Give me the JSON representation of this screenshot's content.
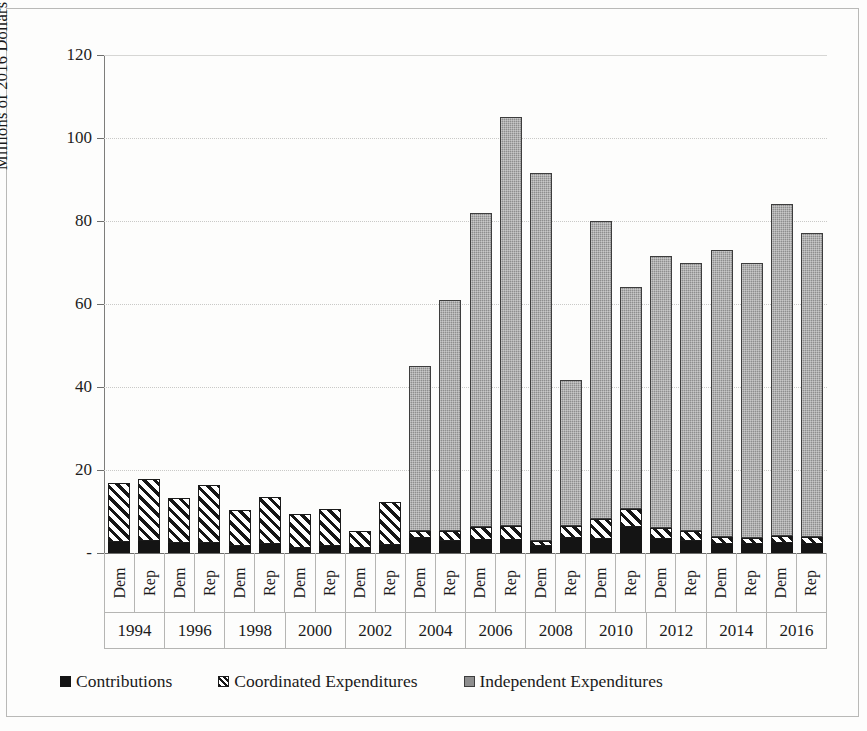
{
  "chart_data": {
    "type": "bar",
    "stacked": true,
    "title": "",
    "xlabel": "",
    "ylabel": "Millions of 2016 Dollars",
    "ylim": [
      0,
      120
    ],
    "ytick_labels": [
      "-",
      "20",
      "40",
      "60",
      "80",
      "100",
      "120"
    ],
    "ytick_values": [
      0,
      20,
      40,
      60,
      80,
      100,
      120
    ],
    "grid": true,
    "legend_position": "bottom",
    "years": [
      "1994",
      "1996",
      "1998",
      "2000",
      "2002",
      "2004",
      "2006",
      "2008",
      "2010",
      "2012",
      "2014",
      "2016"
    ],
    "parties": [
      "Dem",
      "Rep"
    ],
    "categories": [
      "1994 Dem",
      "1994 Rep",
      "1996 Dem",
      "1996 Rep",
      "1998 Dem",
      "1998 Rep",
      "2000 Dem",
      "2000 Rep",
      "2002 Dem",
      "2002 Rep",
      "2004 Dem",
      "2004 Rep",
      "2006 Dem",
      "2006 Rep",
      "2008 Dem",
      "2008 Rep",
      "2010 Dem",
      "2010 Rep",
      "2012 Dem",
      "2012 Rep",
      "2014 Dem",
      "2014 Rep",
      "2016 Dem",
      "2016 Rep"
    ],
    "series": [
      {
        "name": "Contributions",
        "color": "#141414",
        "pattern": "solid-black",
        "values": [
          2.6,
          2.8,
          2.3,
          2.5,
          1.8,
          2.2,
          1.3,
          1.7,
          1.2,
          2.0,
          3.6,
          3.0,
          3.2,
          3.1,
          1.6,
          3.6,
          3.4,
          6.2,
          3.3,
          3.0,
          2.2,
          2.2,
          2.3,
          2.2
        ]
      },
      {
        "name": "Coordinated Expenditures",
        "color": "#ffffff",
        "pattern": "diagonal-hatch",
        "values": [
          14.2,
          15.1,
          10.9,
          13.9,
          8.5,
          11.2,
          8.1,
          9.0,
          4.0,
          10.2,
          1.7,
          2.3,
          3.0,
          3.4,
          1.2,
          3.0,
          4.8,
          4.3,
          2.8,
          2.3,
          1.6,
          1.5,
          1.9,
          1.6
        ]
      },
      {
        "name": "Independent Expenditures",
        "color": "#8e8e8e",
        "pattern": "gray-dither",
        "values": [
          0,
          0,
          0,
          0,
          0,
          0,
          0,
          0,
          0,
          0,
          39.7,
          55.7,
          75.8,
          98.5,
          88.7,
          35.0,
          71.8,
          53.5,
          65.4,
          64.7,
          69.2,
          66.3,
          79.8,
          73.2
        ]
      }
    ],
    "totals": [
      16.8,
      17.9,
      13.2,
      16.4,
      10.3,
      13.4,
      9.4,
      10.7,
      5.2,
      12.2,
      45.0,
      61.0,
      82.0,
      105.0,
      93.5,
      41.6,
      80.0,
      64.0,
      71.5,
      70.0,
      73.0,
      70.0,
      84.0,
      77.0
    ]
  },
  "legend": {
    "items": [
      {
        "label": "Contributions",
        "swatch": "contrib"
      },
      {
        "label": "Coordinated Expenditures",
        "swatch": "coord"
      },
      {
        "label": "Independent Expenditures",
        "swatch": "indep"
      }
    ]
  }
}
